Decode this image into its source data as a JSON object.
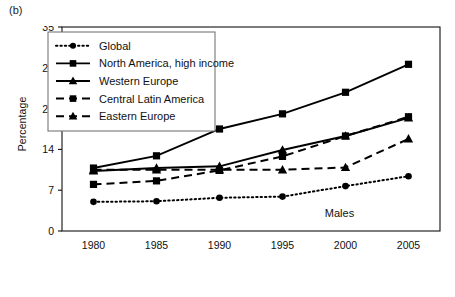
{
  "panel": {
    "label": "(b)"
  },
  "axes": {
    "ylabel": "Percentage",
    "yticks": [
      "0",
      "7",
      "14",
      "21",
      "28",
      "35"
    ],
    "xticks": [
      "1980",
      "1985",
      "1990",
      "1995",
      "2000",
      "2005"
    ]
  },
  "annotation": {
    "text": "Males"
  },
  "legend": {
    "items": [
      {
        "label": "Global"
      },
      {
        "label": "North America, high income"
      },
      {
        "label": "Western Europe"
      },
      {
        "label": "Central Latin America"
      },
      {
        "label": "Eastern Europe"
      }
    ]
  },
  "colors": {
    "ink": "#000000",
    "frame": "#111111",
    "legend_border": "#777777"
  },
  "chart_data": {
    "type": "line",
    "title": "",
    "subtitle": "",
    "xlabel": "",
    "ylabel": "Percentage",
    "annotations": [
      "Males",
      "(b)"
    ],
    "x": [
      1980,
      1985,
      1990,
      1995,
      2000,
      2005
    ],
    "categories": [
      "1980",
      "1985",
      "1990",
      "1995",
      "2000",
      "2005"
    ],
    "xlim": [
      1977.5,
      2007.5
    ],
    "ylim": [
      0,
      35
    ],
    "yticks": [
      0,
      7,
      14,
      21,
      28,
      35
    ],
    "grid": false,
    "legend_position": "upper-left",
    "series": [
      {
        "name": "Global",
        "values": [
          5.0,
          5.1,
          5.7,
          5.9,
          7.7,
          9.4
        ],
        "marker": "circle",
        "linestyle": "dotted"
      },
      {
        "name": "North America, high income",
        "values": [
          10.8,
          12.9,
          17.5,
          20.1,
          23.8,
          28.6
        ],
        "marker": "square",
        "linestyle": "solid"
      },
      {
        "name": "Western Europe",
        "values": [
          10.3,
          10.8,
          11.1,
          13.9,
          16.3,
          19.4
        ],
        "marker": "triangle",
        "linestyle": "solid"
      },
      {
        "name": "Central Latin America",
        "values": [
          8.0,
          8.6,
          10.4,
          12.8,
          16.3,
          19.6
        ],
        "marker": "square",
        "linestyle": "dashed"
      },
      {
        "name": "Eastern Europe",
        "values": [
          10.5,
          10.5,
          10.5,
          10.5,
          10.9,
          15.8
        ],
        "marker": "triangle",
        "linestyle": "dashed"
      }
    ]
  }
}
